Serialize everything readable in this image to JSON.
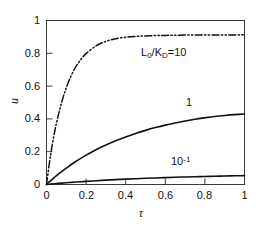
{
  "chart_data": {
    "type": "line",
    "title": "",
    "xlabel": "τ",
    "ylabel": "u",
    "xlim": [
      0,
      1
    ],
    "ylim": [
      0,
      1
    ],
    "grid": false,
    "legend_position": "inline-annotations",
    "x_ticks": [
      "0",
      "0.2",
      "0.4",
      "0.6",
      "0.8",
      "1"
    ],
    "x_tick_values": [
      0,
      0.2,
      0.4,
      0.6,
      0.8,
      1
    ],
    "y_ticks": [
      "0",
      "0.2",
      "0.4",
      "0.6",
      "0.8",
      "1"
    ],
    "y_tick_values": [
      0,
      0.2,
      0.4,
      0.6,
      0.8,
      1
    ],
    "x": [
      0,
      0.02,
      0.04,
      0.06,
      0.08,
      0.1,
      0.125,
      0.15,
      0.175,
      0.2,
      0.25,
      0.3,
      0.35,
      0.4,
      0.45,
      0.5,
      0.55,
      0.6,
      0.65,
      0.7,
      0.75,
      0.8,
      0.85,
      0.9,
      0.95,
      1
    ],
    "series": [
      {
        "name": "L0/KD=10",
        "label": "L₀/Kᴅ=10",
        "style": "dash-dot-dot",
        "color": "#111111",
        "values": [
          0,
          0.175,
          0.315,
          0.425,
          0.515,
          0.59,
          0.665,
          0.722,
          0.765,
          0.798,
          0.845,
          0.873,
          0.889,
          0.898,
          0.903,
          0.906,
          0.908,
          0.909,
          0.91,
          0.911,
          0.911,
          0.912,
          0.912,
          0.912,
          0.912,
          0.913
        ]
      },
      {
        "name": "1",
        "label": "1",
        "style": "solid",
        "color": "#111111",
        "values": [
          0,
          0.022,
          0.043,
          0.063,
          0.082,
          0.1,
          0.122,
          0.142,
          0.161,
          0.179,
          0.212,
          0.241,
          0.267,
          0.29,
          0.311,
          0.33,
          0.347,
          0.362,
          0.375,
          0.387,
          0.398,
          0.407,
          0.415,
          0.421,
          0.426,
          0.43
        ]
      },
      {
        "name": "10^-1",
        "label": "10⁻¹",
        "style": "solid",
        "color": "#111111",
        "values": [
          0,
          0.0023,
          0.0045,
          0.0066,
          0.0086,
          0.0105,
          0.0128,
          0.015,
          0.0171,
          0.0191,
          0.0229,
          0.0264,
          0.0296,
          0.0325,
          0.0352,
          0.0377,
          0.04,
          0.0421,
          0.0441,
          0.0459,
          0.0475,
          0.049,
          0.0504,
          0.0517,
          0.0529,
          0.054
        ]
      }
    ],
    "annotations": [
      {
        "id": "ann-l0kd",
        "text_prefix": "L",
        "sub1": "0",
        "mid": "/K",
        "sub2": "D",
        "suffix": "=10"
      },
      {
        "id": "ann-one",
        "text": "1"
      },
      {
        "id": "ann-tenth",
        "base": "10",
        "exp": "-1"
      }
    ]
  },
  "axes": {
    "x_label": "τ",
    "y_label": "u"
  },
  "colors": {
    "line": "#111111",
    "axis": "#3a3a3a",
    "background": "#ffffff"
  }
}
